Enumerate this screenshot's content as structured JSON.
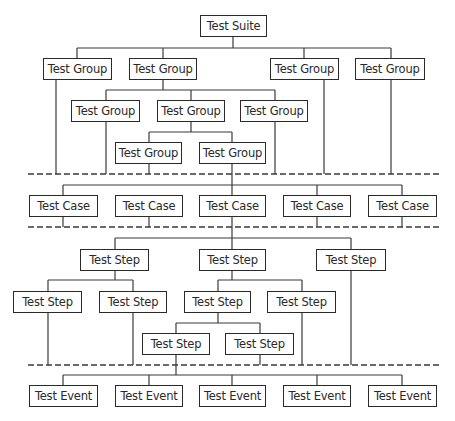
{
  "diagram": {
    "type": "hierarchy",
    "colors": {
      "line": "#3a3a3a",
      "box_border": "#2a2a2a",
      "text": "#2a2a2a",
      "background": "#ffffff"
    },
    "nodes": [
      {
        "id": "suite",
        "label": "Test Suite",
        "x": 200,
        "y": 15,
        "w": 67,
        "h": 22
      },
      {
        "id": "g1",
        "label": "Test Group",
        "x": 43,
        "y": 58,
        "w": 69,
        "h": 22
      },
      {
        "id": "g2",
        "label": "Test Group",
        "x": 129,
        "y": 58,
        "w": 68,
        "h": 22
      },
      {
        "id": "g3",
        "label": "Test Group",
        "x": 270,
        "y": 58,
        "w": 69,
        "h": 22
      },
      {
        "id": "g4",
        "label": "Test Group",
        "x": 355,
        "y": 58,
        "w": 70,
        "h": 22
      },
      {
        "id": "g21",
        "label": "Test Group",
        "x": 71,
        "y": 100,
        "w": 69,
        "h": 22
      },
      {
        "id": "g22",
        "label": "Test Group",
        "x": 157,
        "y": 100,
        "w": 68,
        "h": 22
      },
      {
        "id": "g23",
        "label": "Test Group",
        "x": 240,
        "y": 100,
        "w": 68,
        "h": 22
      },
      {
        "id": "g31",
        "label": "Test Group",
        "x": 115,
        "y": 142,
        "w": 67,
        "h": 22
      },
      {
        "id": "g32",
        "label": "Test Group",
        "x": 199,
        "y": 142,
        "w": 67,
        "h": 22
      },
      {
        "id": "c1",
        "label": "Test Case",
        "x": 29,
        "y": 195,
        "w": 69,
        "h": 22
      },
      {
        "id": "c2",
        "label": "Test Case",
        "x": 115,
        "y": 195,
        "w": 68,
        "h": 22
      },
      {
        "id": "c3",
        "label": "Test Case",
        "x": 199,
        "y": 195,
        "w": 67,
        "h": 22
      },
      {
        "id": "c4",
        "label": "Test Case",
        "x": 283,
        "y": 195,
        "w": 68,
        "h": 22
      },
      {
        "id": "c5",
        "label": "Test Case",
        "x": 368,
        "y": 195,
        "w": 69,
        "h": 22
      },
      {
        "id": "s1",
        "label": "Test Step",
        "x": 80,
        "y": 249,
        "w": 69,
        "h": 22
      },
      {
        "id": "s2",
        "label": "Test Step",
        "x": 199,
        "y": 249,
        "w": 67,
        "h": 22
      },
      {
        "id": "s3",
        "label": "Test Step",
        "x": 316,
        "y": 249,
        "w": 70,
        "h": 22
      },
      {
        "id": "s11",
        "label": "Test Step",
        "x": 13,
        "y": 291,
        "w": 69,
        "h": 22
      },
      {
        "id": "s12",
        "label": "Test Step",
        "x": 99,
        "y": 291,
        "w": 68,
        "h": 22
      },
      {
        "id": "s21",
        "label": "Test Step",
        "x": 184,
        "y": 291,
        "w": 67,
        "h": 22
      },
      {
        "id": "s22",
        "label": "Test Step",
        "x": 267,
        "y": 291,
        "w": 69,
        "h": 22
      },
      {
        "id": "s211",
        "label": "Test Step",
        "x": 142,
        "y": 333,
        "w": 68,
        "h": 22
      },
      {
        "id": "s212",
        "label": "Test Step",
        "x": 225,
        "y": 333,
        "w": 69,
        "h": 22
      },
      {
        "id": "e1",
        "label": "Test Event",
        "x": 29,
        "y": 385,
        "w": 69,
        "h": 22
      },
      {
        "id": "e2",
        "label": "Test Event",
        "x": 115,
        "y": 385,
        "w": 68,
        "h": 22
      },
      {
        "id": "e3",
        "label": "Test Event",
        "x": 199,
        "y": 385,
        "w": 67,
        "h": 22
      },
      {
        "id": "e4",
        "label": "Test Event",
        "x": 283,
        "y": 385,
        "w": 68,
        "h": 22
      },
      {
        "id": "e5",
        "label": "Test Event",
        "x": 368,
        "y": 385,
        "w": 69,
        "h": 22
      }
    ],
    "lines": [
      [
        233,
        37,
        233,
        48
      ],
      [
        77,
        48,
        391,
        48
      ],
      [
        77,
        48,
        77,
        58
      ],
      [
        163,
        48,
        163,
        58
      ],
      [
        304,
        48,
        304,
        58
      ],
      [
        391,
        48,
        391,
        58
      ],
      [
        163,
        80,
        163,
        90
      ],
      [
        106,
        90,
        275,
        90
      ],
      [
        106,
        90,
        106,
        100
      ],
      [
        191,
        90,
        191,
        100
      ],
      [
        275,
        90,
        275,
        100
      ],
      [
        191,
        122,
        191,
        132
      ],
      [
        149,
        132,
        232,
        132
      ],
      [
        149,
        132,
        149,
        142
      ],
      [
        232,
        132,
        232,
        142
      ],
      [
        56,
        80,
        56,
        174
      ],
      [
        106,
        122,
        106,
        174
      ],
      [
        149,
        164,
        149,
        174
      ],
      [
        275,
        122,
        275,
        174
      ],
      [
        324,
        80,
        324,
        174
      ],
      [
        391,
        80,
        391,
        174
      ],
      [
        232,
        164,
        232,
        249
      ],
      [
        63,
        185,
        402,
        185
      ],
      [
        63,
        185,
        63,
        195
      ],
      [
        317,
        185,
        317,
        195
      ],
      [
        402,
        185,
        402,
        195
      ],
      [
        63,
        217,
        63,
        227
      ],
      [
        149,
        217,
        149,
        227
      ],
      [
        317,
        217,
        317,
        227
      ],
      [
        402,
        217,
        402,
        227
      ],
      [
        115,
        238,
        351,
        238
      ],
      [
        115,
        238,
        115,
        249
      ],
      [
        351,
        238,
        351,
        249
      ],
      [
        115,
        271,
        115,
        280
      ],
      [
        48,
        280,
        133,
        280
      ],
      [
        48,
        280,
        48,
        291
      ],
      [
        133,
        280,
        133,
        291
      ],
      [
        232,
        271,
        232,
        280
      ],
      [
        218,
        280,
        302,
        280
      ],
      [
        218,
        280,
        218,
        291
      ],
      [
        302,
        280,
        302,
        291
      ],
      [
        218,
        313,
        218,
        323
      ],
      [
        176,
        323,
        260,
        323
      ],
      [
        176,
        323,
        176,
        333
      ],
      [
        260,
        323,
        260,
        333
      ],
      [
        48,
        313,
        48,
        365
      ],
      [
        133,
        313,
        133,
        365
      ],
      [
        260,
        355,
        260,
        365
      ],
      [
        302,
        313,
        302,
        365
      ],
      [
        351,
        271,
        351,
        365
      ],
      [
        176,
        355,
        176,
        375
      ],
      [
        63,
        375,
        402,
        375
      ],
      [
        63,
        375,
        63,
        385
      ],
      [
        149,
        375,
        149,
        385
      ],
      [
        232,
        375,
        232,
        385
      ],
      [
        317,
        375,
        317,
        385
      ],
      [
        402,
        375,
        402,
        385
      ]
    ],
    "dashed_separators": [
      {
        "y": 174,
        "x1": 28,
        "x2": 440
      },
      {
        "y": 227,
        "x1": 28,
        "x2": 440
      },
      {
        "y": 365,
        "x1": 28,
        "x2": 440
      }
    ]
  }
}
